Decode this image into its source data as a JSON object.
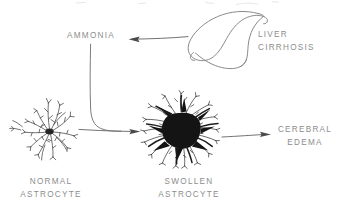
{
  "diagram": {
    "background_color": "#ffffff",
    "ink_color": "#6f6f6f",
    "text_color": "#8d8d8d",
    "nodes": [
      {
        "id": "ammonia",
        "label": "AMMONIA",
        "kind": "text-node"
      },
      {
        "id": "liver",
        "label": "LIVER\nCIRRHOSIS",
        "kind": "organ-illustration"
      },
      {
        "id": "normal",
        "label": "NORMAL\nASTROCYTE",
        "kind": "cell-illustration"
      },
      {
        "id": "swollen",
        "label": "SWOLLEN\nASTROCYTE",
        "kind": "cell-illustration"
      },
      {
        "id": "cerebral_edema",
        "label": "CEREBRAL\nEDEMA",
        "kind": "text-node"
      }
    ],
    "arrows": [
      {
        "from": "liver",
        "to": "ammonia",
        "direction": "left"
      },
      {
        "from": "ammonia",
        "to": "swollen",
        "direction": "down-right"
      },
      {
        "from": "normal",
        "to": "swollen",
        "direction": "right"
      },
      {
        "from": "swollen",
        "to": "cerebral_edema",
        "direction": "right"
      }
    ]
  },
  "labels": {
    "ammonia": "AMMONIA",
    "liver": "LIVER\nCIRRHOSIS",
    "cerebral_edema": "CEREBRAL\nEDEMA",
    "normal_astrocyte": "NORMAL\nASTROCYTE",
    "swollen_astrocyte": "SWOLLEN\nASTROCYTE"
  }
}
